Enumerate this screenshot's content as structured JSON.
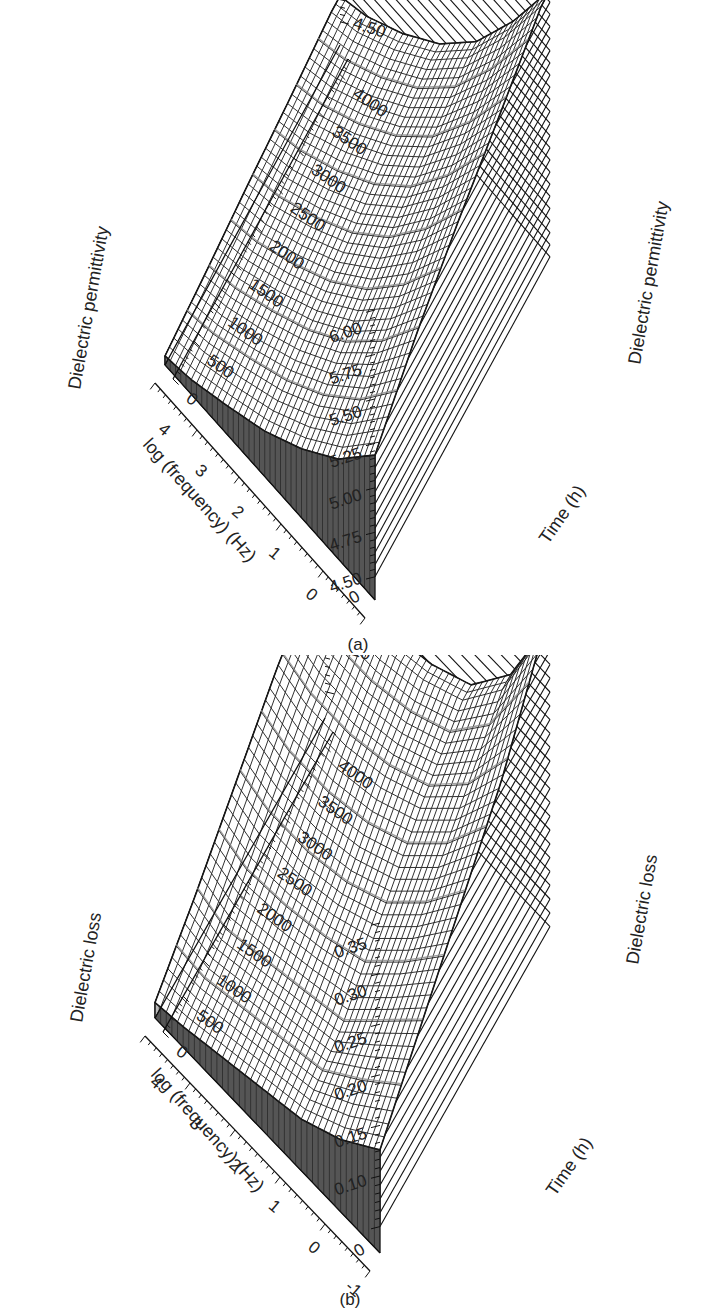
{
  "chart_data": [
    {
      "panel": "a",
      "caption": "(a)",
      "type": "surface3d",
      "title": "",
      "z_label": "Dielectric permittivity",
      "x_label": "log (frequency) (Hz)",
      "y_label": "Time (h)",
      "z_ticks": [
        "4.50",
        "4.75",
        "5.00",
        "5.25",
        "5.50",
        "5.75",
        "6.00"
      ],
      "zlim": [
        4.5,
        6.1
      ],
      "x_ticks": [
        "0",
        "1",
        "2",
        "3",
        "4"
      ],
      "xlim": [
        -1,
        4.7
      ],
      "y_ticks": [
        "0",
        "500",
        "1000",
        "1500",
        "2000",
        "2500",
        "3000",
        "3500",
        "4000"
      ],
      "ylim": [
        0,
        4200
      ],
      "corner_label": "0",
      "x": [
        -1,
        0,
        1,
        2,
        3,
        4,
        4.7
      ],
      "y": [
        0,
        1000,
        2000,
        3000,
        4000
      ],
      "z": [
        [
          5.3,
          5.05,
          4.88,
          4.75,
          4.66,
          4.58,
          4.55
        ],
        [
          5.55,
          5.25,
          5.02,
          4.86,
          4.74,
          4.64,
          4.6
        ],
        [
          5.75,
          5.42,
          5.15,
          4.95,
          4.81,
          4.7,
          4.66
        ],
        [
          5.92,
          5.56,
          5.26,
          5.04,
          4.88,
          4.76,
          4.71
        ],
        [
          6.1,
          5.7,
          5.36,
          5.12,
          4.95,
          4.82,
          4.77
        ]
      ],
      "grid": true,
      "legend": null
    },
    {
      "panel": "b",
      "caption": "(b)",
      "type": "surface3d",
      "title": "",
      "z_label": "Dielectric loss",
      "x_label": "log (frequency) (Hz)",
      "y_label": "Time (h)",
      "z_ticks": [
        "0.10",
        "0.15",
        "0.20",
        "0.25",
        "0.30",
        "0.35"
      ],
      "zlim": [
        0.05,
        0.37
      ],
      "x_ticks": [
        "-1",
        "0",
        "1",
        "2",
        "3",
        "4"
      ],
      "xlim": [
        -1,
        4.7
      ],
      "y_ticks": [
        "0",
        "500",
        "1000",
        "1500",
        "2000",
        "2500",
        "3000",
        "3500",
        "4000"
      ],
      "ylim": [
        0,
        4200
      ],
      "corner_label": "0",
      "x": [
        -1,
        0,
        1,
        2,
        3,
        4,
        4.7
      ],
      "y": [
        0,
        1000,
        2000,
        3000,
        4000
      ],
      "z": [
        [
          0.15,
          0.12,
          0.1,
          0.09,
          0.08,
          0.07,
          0.065
        ],
        [
          0.2,
          0.16,
          0.12,
          0.11,
          0.1,
          0.09,
          0.1
        ],
        [
          0.25,
          0.2,
          0.16,
          0.14,
          0.13,
          0.13,
          0.14
        ],
        [
          0.3,
          0.24,
          0.2,
          0.18,
          0.17,
          0.17,
          0.18
        ],
        [
          0.37,
          0.28,
          0.23,
          0.21,
          0.2,
          0.2,
          0.21
        ]
      ],
      "grid": true,
      "legend": null
    }
  ]
}
